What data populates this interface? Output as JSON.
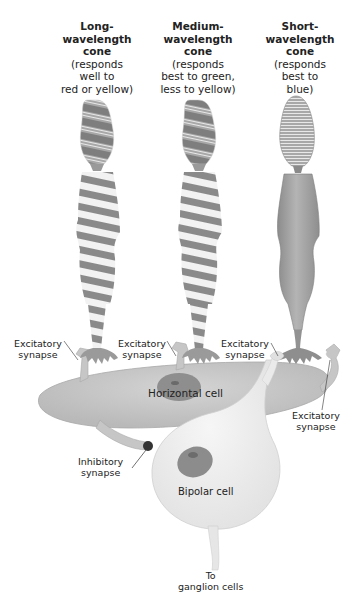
{
  "diagram": {
    "cones": [
      {
        "id": "long",
        "title_lines": [
          "Long-",
          "wavelength",
          "cone"
        ],
        "desc_lines": [
          "(responds",
          "well to",
          "red or yellow)"
        ]
      },
      {
        "id": "medium",
        "title_lines": [
          "Medium-",
          "wavelength",
          "cone"
        ],
        "desc_lines": [
          "(responds",
          "best to green,",
          "less to yellow)"
        ]
      },
      {
        "id": "short",
        "title_lines": [
          "Short-",
          "wavelength",
          "cone"
        ],
        "desc_lines": [
          "(responds",
          "best to",
          "blue)"
        ]
      }
    ],
    "labels": {
      "excitatory_1": [
        "Excitatory",
        "synapse"
      ],
      "excitatory_2": [
        "Excitatory",
        "synapse"
      ],
      "excitatory_3": [
        "Excitatory",
        "synapse"
      ],
      "excitatory_4": [
        "Excitatory",
        "synapse"
      ],
      "inhibitory": [
        "Inhibitory",
        "synapse"
      ],
      "horizontal_cell": "Horizontal cell",
      "bipolar_cell": "Bipolar cell",
      "to_ganglion": [
        "To",
        "ganglion cells"
      ]
    },
    "colors": {
      "stripe_dark": "#8a8a8a",
      "stripe_light": "#f2f2f2",
      "short_cone": "#9a9a9a",
      "horizontal_cell": "#c8c8c8",
      "bipolar_cell": "#ececec",
      "nucleus": "#8c8c8c",
      "inhibitory_synapse": "#333333"
    }
  }
}
